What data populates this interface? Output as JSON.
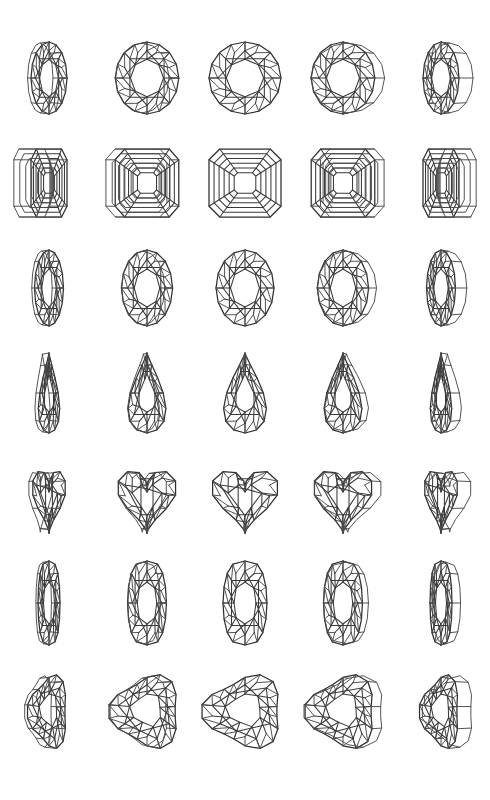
{
  "sheet": {
    "title": "Gemstone Cut Facet Diagrams",
    "description": "Line-art plate of seven gemstone cuts, each shown in five rotational views from left-tilted profile through face-up to right-tilted profile.",
    "background_color": "#ffffff",
    "line_color": "#3a3a3a",
    "columns": 5,
    "rows": 7,
    "width": 490,
    "height": 800
  },
  "view_angles": [
    {
      "index": 0,
      "label": "tilted left",
      "tilt": -60
    },
    {
      "index": 1,
      "label": "three-quarter left",
      "tilt": -28
    },
    {
      "index": 2,
      "label": "face up",
      "tilt": 0
    },
    {
      "index": 3,
      "label": "three-quarter right",
      "tilt": 28
    },
    {
      "index": 4,
      "label": "tilted right",
      "tilt": 60
    }
  ],
  "rows": [
    {
      "index": 0,
      "name": "round-brilliant",
      "label": "Round Brilliant",
      "style": "brilliant",
      "shape": "round",
      "rx": 36,
      "ry": 36,
      "table_scale": 0.52,
      "crown_points": 8,
      "girdle_points": 16,
      "star_offset": 0.5
    },
    {
      "index": 1,
      "name": "emerald-step",
      "label": "Emerald / Asscher Step Cut",
      "style": "step",
      "shape": "octagon",
      "rx": 36,
      "ry": 34,
      "corner": 0.3,
      "steps": 5,
      "table_scale": 0.3
    },
    {
      "index": 2,
      "name": "oval-brilliant",
      "label": "Oval Brilliant",
      "style": "brilliant",
      "shape": "oval",
      "rx": 29,
      "ry": 38,
      "table_scale": 0.5,
      "crown_points": 8,
      "girdle_points": 16,
      "star_offset": 0.5
    },
    {
      "index": 3,
      "name": "pear-brilliant",
      "label": "Pear Brilliant",
      "style": "brilliant",
      "shape": "pear",
      "rx": 27,
      "ry": 40,
      "table_scale": 0.48,
      "crown_points": 8,
      "girdle_points": 16,
      "star_offset": 0.5
    },
    {
      "index": 4,
      "name": "heart-brilliant",
      "label": "Heart Brilliant",
      "style": "brilliant",
      "shape": "heart",
      "rx": 36,
      "ry": 36,
      "table_scale": 0.5,
      "crown_points": 8,
      "girdle_points": 18,
      "star_offset": 0.5
    },
    {
      "index": 5,
      "name": "marquise-brilliant",
      "label": "Marquise Brilliant",
      "style": "brilliant",
      "shape": "marquise",
      "rx": 22,
      "ry": 42,
      "table_scale": 0.5,
      "crown_points": 8,
      "girdle_points": 16,
      "star_offset": 0.5
    },
    {
      "index": 6,
      "name": "trillion-brilliant",
      "label": "Trillion Brilliant",
      "style": "brilliant",
      "shape": "trillion",
      "rx": 38,
      "ry": 36,
      "table_scale": 0.46,
      "crown_points": 9,
      "girdle_points": 18,
      "star_offset": 0.5
    }
  ]
}
